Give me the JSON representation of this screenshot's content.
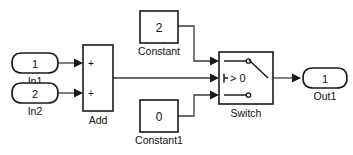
{
  "diagram": {
    "background_color": "#ffffff",
    "line_color": "#333333",
    "block_stroke_color": "#1a1a1a",
    "block_fill_color": "#ffffff"
  },
  "blocks": {
    "in1": {
      "port_number": "1",
      "label": "In1",
      "type": "inport"
    },
    "in2": {
      "port_number": "2",
      "label": "In2",
      "type": "inport"
    },
    "add": {
      "label": "Add",
      "sign_top": "+",
      "sign_bottom": "+",
      "type": "sum"
    },
    "constant": {
      "value": "2",
      "label": "Constant",
      "type": "constant"
    },
    "constant1": {
      "value": "0",
      "label": "Constant1",
      "type": "constant"
    },
    "switch": {
      "label": "Switch",
      "criteria": "> 0",
      "type": "switch"
    },
    "out1": {
      "port_number": "1",
      "label": "Out1",
      "type": "outport"
    }
  }
}
